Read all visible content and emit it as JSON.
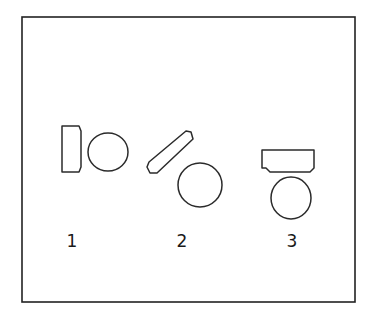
{
  "figure": {
    "background_color": "#ffffff",
    "stroke_color": "#2b2b2b",
    "frame_color": "#222222",
    "frame": {
      "x": 22,
      "y": 17,
      "width": 333,
      "height": 285
    },
    "canvas": {
      "width": 375,
      "height": 317
    }
  },
  "panels": [
    {
      "id": "panel-1",
      "label": "1",
      "label_x": 72,
      "label_y": 247,
      "description": "upright rectangle beside a circle",
      "shapes": [
        {
          "name": "rectangle",
          "kind": "rect",
          "points": "62,126 79,126 81,131 81,167 79,172 62,172",
          "rotation_deg": 0
        },
        {
          "name": "circle",
          "kind": "ellipse",
          "cx": 108,
          "cy": 152,
          "rx": 20,
          "ry": 19,
          "rotation_deg": 0
        }
      ]
    },
    {
      "id": "panel-2",
      "label": "2",
      "label_x": 182,
      "label_y": 247,
      "description": "tilted rectangle above and left of a circle",
      "shapes": [
        {
          "name": "rectangle",
          "kind": "rect",
          "points": "149,162 186,131 191,132 193,139 157,173 150,173 147,167",
          "rotation_deg": -40
        },
        {
          "name": "circle",
          "kind": "ellipse",
          "cx": 200,
          "cy": 185,
          "rx": 22,
          "ry": 22,
          "rotation_deg": 0
        }
      ]
    },
    {
      "id": "panel-3",
      "label": "3",
      "label_x": 292,
      "label_y": 247,
      "description": "horizontal rectangle above an ellipse",
      "shapes": [
        {
          "name": "rectangle",
          "kind": "rect",
          "points": "262,150 314,150 314,168 310,172 270,172 266,168 262,168",
          "rotation_deg": 0
        },
        {
          "name": "ellipse",
          "kind": "ellipse",
          "cx": 291,
          "cy": 198,
          "rx": 20,
          "ry": 21,
          "rotation_deg": 0
        }
      ]
    }
  ]
}
